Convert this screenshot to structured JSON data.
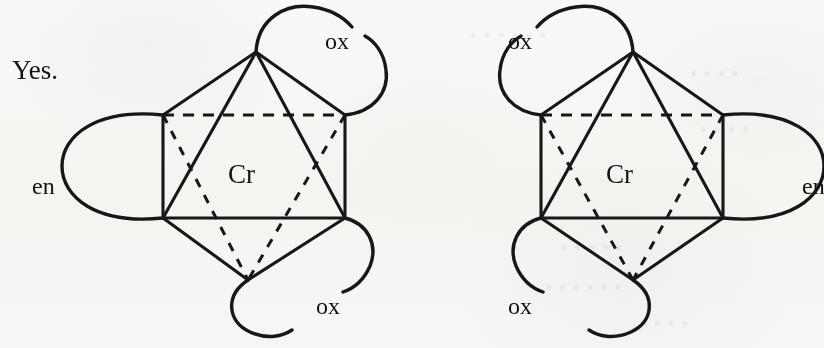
{
  "answer": {
    "text": "Yes."
  },
  "diagram": {
    "caption_colors": {
      "ink": "#17171a",
      "paper": "#fbfbfa"
    },
    "structures": [
      {
        "id": "left",
        "chirality": "delta",
        "metal": "Cr",
        "ligands": [
          {
            "name": "ox",
            "position": "top-right"
          },
          {
            "name": "en",
            "position": "left"
          },
          {
            "name": "ox",
            "position": "bottom-right"
          }
        ]
      },
      {
        "id": "right",
        "chirality": "lambda",
        "metal": "Cr",
        "ligands": [
          {
            "name": "ox",
            "position": "top-left"
          },
          {
            "name": "en",
            "position": "right"
          },
          {
            "name": "ox",
            "position": "bottom-left"
          }
        ]
      }
    ]
  }
}
